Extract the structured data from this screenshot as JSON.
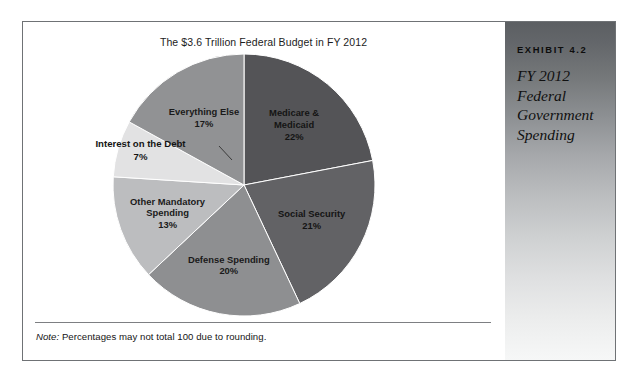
{
  "exhibit": {
    "number_label": "EXHIBIT 4.2",
    "caption": "FY 2012 Federal Government Spending",
    "caption_lines": [
      "FY 2012",
      "Federal",
      "Government",
      "Spending"
    ]
  },
  "chart_data": {
    "type": "pie",
    "title": "The $3.6 Trillion Federal Budget in FY 2012",
    "xlabel": "",
    "ylabel": "",
    "legend": "none (labels drawn on slices)",
    "grid": false,
    "units": "percent of total federal budget",
    "total_label": "$3.6 Trillion",
    "fiscal_year": "FY 2012",
    "start_angle_deg": 0,
    "direction": "clockwise",
    "categories": [
      "Medicare & Medicaid",
      "Social Security",
      "Defense Spending",
      "Other Mandatory Spending",
      "Interest on the Debt",
      "Everything Else"
    ],
    "values": [
      22,
      21,
      20,
      13,
      7,
      17
    ],
    "slices": [
      {
        "name": "Medicare & Medicaid",
        "label_lines": [
          "Medicare &",
          "Medicaid",
          "22%"
        ],
        "value": 22,
        "value_label": "22%",
        "color": "#545457",
        "label_placement": "inside",
        "label_tone": "on-dark"
      },
      {
        "name": "Social Security",
        "label_lines": [
          "Social Security",
          "21%"
        ],
        "value": 21,
        "value_label": "21%",
        "color": "#626265",
        "label_placement": "inside",
        "label_tone": "on-dark"
      },
      {
        "name": "Defense Spending",
        "label_lines": [
          "Defense Spending",
          "20%"
        ],
        "value": 20,
        "value_label": "20%",
        "color": "#8e8f91",
        "label_placement": "inside",
        "label_tone": "on-light"
      },
      {
        "name": "Other Mandatory Spending",
        "label_lines": [
          "Other Mandatory",
          "Spending",
          "13%"
        ],
        "value": 13,
        "value_label": "13%",
        "color": "#bcbdbf",
        "label_placement": "inside",
        "label_tone": "on-light"
      },
      {
        "name": "Interest on the Debt",
        "label_lines": [
          "Interest on the Debt",
          "7%"
        ],
        "value": 7,
        "value_label": "7%",
        "color": "#e2e2e3",
        "label_placement": "outside-callout",
        "label_tone": "on-light"
      },
      {
        "name": "Everything Else",
        "label_lines": [
          "Everything Else",
          "17%"
        ],
        "value": 17,
        "value_label": "17%",
        "color": "#919294",
        "label_placement": "inside",
        "label_tone": "on-light"
      }
    ]
  },
  "note": {
    "lead": "Note:",
    "body": " Percentages may not total 100 due to rounding."
  }
}
